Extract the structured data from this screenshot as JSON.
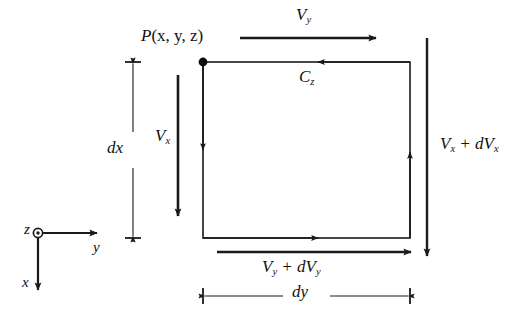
{
  "figure": {
    "type": "technical-diagram",
    "background_color": "#ffffff",
    "line_color": "#1a1a1a"
  },
  "point_label": {
    "name": "P(x, y, z)",
    "base": "P",
    "args": "(x, y, z)",
    "marker": "filled-dot",
    "at_corner": "top-left"
  },
  "control_volume": {
    "name": "rectangular fluid element",
    "left_px": 203,
    "top_px": 62,
    "right_px": 410,
    "bottom_px": 238,
    "stroke_width": 1.6,
    "circulation_arrowheads": [
      {
        "edge": "left",
        "direction": "down"
      },
      {
        "edge": "top",
        "direction": "left"
      },
      {
        "edge": "right",
        "direction": "up"
      },
      {
        "edge": "bottom",
        "direction": "right"
      }
    ]
  },
  "vectors": [
    {
      "id": "v-y-top",
      "label": "V_y",
      "base": "V",
      "sub": "y",
      "direction": "right",
      "label_position": "above",
      "x1": 240,
      "y1": 38,
      "x2": 376,
      "y2": 38
    },
    {
      "id": "v-x-left",
      "label": "V_x",
      "base": "V",
      "sub": "x",
      "direction": "down",
      "label_position": "left",
      "x1": 178,
      "y1": 75,
      "x2": 178,
      "y2": 216
    },
    {
      "id": "v-x-plus-dv-x-right",
      "label": "V_x + dV_x",
      "base": "V",
      "sub": "x",
      "operator": "+",
      "increment_d": "d",
      "increment_base": "V",
      "increment_sub": "x",
      "direction": "down",
      "label_position": "right",
      "x1": 427,
      "y1": 38,
      "x2": 427,
      "y2": 256
    },
    {
      "id": "v-y-plus-dv-y-bottom",
      "label": "V_y + dV_y",
      "base": "V",
      "sub": "y",
      "operator": "+",
      "increment_d": "d",
      "increment_base": "V",
      "increment_sub": "y",
      "direction": "right",
      "label_position": "below",
      "x1": 217,
      "y1": 252,
      "x2": 411,
      "y2": 252
    },
    {
      "id": "c-z-circulation",
      "label": "C_z",
      "base": "C",
      "sub": "z",
      "direction": "left",
      "label_position": "below",
      "note": "circulation sense about the z axis, drawn on the top edge of the element"
    }
  ],
  "dimensions": [
    {
      "id": "dx",
      "label": "dx",
      "base": "d",
      "var": "x",
      "orientation": "vertical",
      "x": 133,
      "y1": 62,
      "y2": 238,
      "measures": "height of the element along x"
    },
    {
      "id": "dy",
      "label": "dy",
      "base": "d",
      "var": "y",
      "orientation": "horizontal",
      "y": 296,
      "x1": 203,
      "x2": 410,
      "measures": "width of the element along y"
    }
  ],
  "axes": {
    "name": "coordinate triad",
    "origin_px": [
      38,
      233
    ],
    "z": {
      "label": "z",
      "glyph": "circle-dot-out-of-page",
      "label_side": "left"
    },
    "y": {
      "label": "y",
      "direction": "right",
      "tip_px": [
        97,
        233
      ]
    },
    "x": {
      "label": "x",
      "direction": "down",
      "tip_px": [
        38,
        290
      ]
    }
  }
}
